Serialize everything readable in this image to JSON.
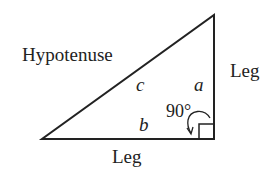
{
  "diagram": {
    "labels": {
      "hypotenuse": "Hypotenuse",
      "leg_vertical": "Leg",
      "leg_horizontal": "Leg",
      "side_c": "c",
      "side_a": "a",
      "side_b": "b",
      "angle": "90°"
    },
    "colors": {
      "stroke": "#222222",
      "background": "#ffffff"
    }
  }
}
